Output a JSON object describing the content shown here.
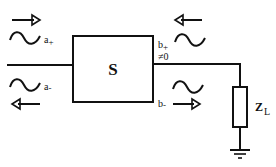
{
  "diagram": {
    "type": "two-port network with load",
    "block": {
      "label": "S"
    },
    "waves": {
      "incident_left": {
        "label": "a",
        "sub": "+"
      },
      "reflected_left": {
        "label": "a",
        "sub": "-"
      },
      "incident_right": {
        "label": "b",
        "sub": "+"
      },
      "reflected_right": {
        "label": "b",
        "sub": "-"
      }
    },
    "annotation": "≠0",
    "load": {
      "label": "Z",
      "sub": "L"
    },
    "arrows": [
      {
        "position": "top-left",
        "direction": "right"
      },
      {
        "position": "bottom-left",
        "direction": "left"
      },
      {
        "position": "top-right",
        "direction": "left"
      },
      {
        "position": "bottom-right",
        "direction": "right"
      }
    ],
    "colors": {
      "line": "#111111",
      "background": "#ffffff"
    }
  }
}
